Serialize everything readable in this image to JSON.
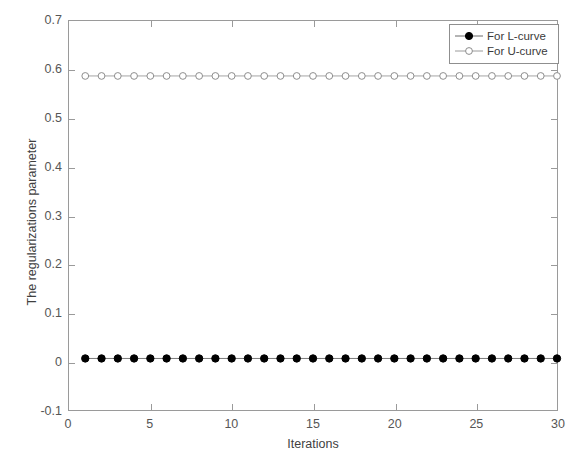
{
  "chart_data": {
    "type": "line",
    "title": "",
    "xlabel": "Iterations",
    "ylabel": "The regularizations parameter",
    "xlim": [
      0,
      30
    ],
    "ylim": [
      -0.1,
      0.7
    ],
    "xticks": [
      0,
      5,
      10,
      15,
      20,
      25,
      30
    ],
    "xtick_labels": [
      "0",
      "5",
      "10",
      "15",
      "20",
      "25",
      "30"
    ],
    "yticks": [
      -0.1,
      0,
      0.1,
      0.2,
      0.3,
      0.4,
      0.5,
      0.6,
      0.7
    ],
    "ytick_labels": [
      "-0.1",
      "0",
      "0.1",
      "0.2",
      "0.3",
      "0.4",
      "0.5",
      "0.6",
      "0.7"
    ],
    "grid": false,
    "legend_position": "top-right",
    "x": [
      1,
      2,
      3,
      4,
      5,
      6,
      7,
      8,
      9,
      10,
      11,
      12,
      13,
      14,
      15,
      16,
      17,
      18,
      19,
      20,
      21,
      22,
      23,
      24,
      25,
      26,
      27,
      28,
      29,
      30
    ],
    "series": [
      {
        "name": "For L-curve",
        "marker": "filled-circle",
        "color": "#000000",
        "line_color": "#6b6b6b",
        "values": [
          0.006,
          0.006,
          0.006,
          0.006,
          0.006,
          0.006,
          0.006,
          0.006,
          0.006,
          0.006,
          0.006,
          0.006,
          0.006,
          0.006,
          0.006,
          0.006,
          0.006,
          0.006,
          0.006,
          0.006,
          0.006,
          0.006,
          0.006,
          0.006,
          0.006,
          0.006,
          0.006,
          0.006,
          0.006,
          0.006
        ]
      },
      {
        "name": "For U-curve",
        "marker": "open-circle",
        "color": "#8c8c8c",
        "line_color": "#9a9a9a",
        "values": [
          0.587,
          0.587,
          0.587,
          0.587,
          0.587,
          0.587,
          0.587,
          0.587,
          0.587,
          0.587,
          0.587,
          0.587,
          0.587,
          0.587,
          0.587,
          0.587,
          0.587,
          0.587,
          0.587,
          0.587,
          0.587,
          0.587,
          0.587,
          0.587,
          0.587,
          0.587,
          0.587,
          0.587,
          0.587,
          0.587
        ]
      }
    ]
  },
  "legend": {
    "entries": [
      {
        "label": "For L-curve"
      },
      {
        "label": "For U-curve"
      }
    ]
  }
}
